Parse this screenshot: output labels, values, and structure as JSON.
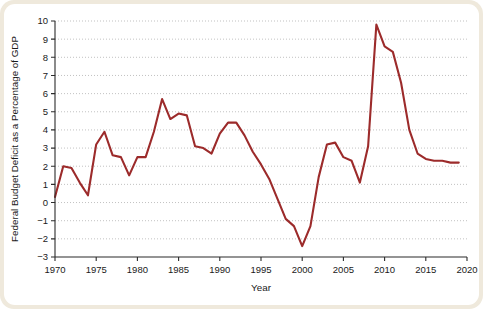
{
  "figure": {
    "frame_color": "#efe9dc",
    "plot_background": "#ffffff"
  },
  "chart_data": {
    "type": "line",
    "title": "",
    "subtitle": "",
    "xlabel": "Year",
    "ylabel": "Federal Budget Deficit as a Percentage of GDP",
    "xlim": [
      1970,
      2020
    ],
    "ylim": [
      -3,
      10
    ],
    "xticks": [
      1970,
      1975,
      1980,
      1985,
      1990,
      1995,
      2000,
      2005,
      2010,
      2015,
      2020
    ],
    "xtick_labels": [
      "1970",
      "1975",
      "1980",
      "1985",
      "1990",
      "1995",
      "2000",
      "2005",
      "2010",
      "2015",
      "2020"
    ],
    "yticks": [
      -3,
      -2,
      -1,
      0,
      1,
      2,
      3,
      4,
      5,
      6,
      7,
      8,
      9,
      10
    ],
    "ytick_labels": [
      "−3",
      "−2",
      "−1",
      "0",
      "1",
      "2",
      "3",
      "4",
      "5",
      "6",
      "7",
      "8",
      "9",
      "10"
    ],
    "grid": true,
    "grid_axis": "y",
    "grid_style": "dotted",
    "legend": false,
    "legend_position": "none",
    "line_color": "#9c2b2b",
    "line_width": 2.1,
    "x": [
      1970,
      1971,
      1972,
      1973,
      1974,
      1975,
      1976,
      1977,
      1978,
      1979,
      1980,
      1981,
      1982,
      1983,
      1984,
      1985,
      1986,
      1987,
      1988,
      1989,
      1990,
      1991,
      1992,
      1993,
      1994,
      1995,
      1996,
      1997,
      1998,
      1999,
      2000,
      2001,
      2002,
      2003,
      2004,
      2005,
      2006,
      2007,
      2008,
      2009,
      2010,
      2011,
      2012,
      2013,
      2014,
      2015,
      2016,
      2017,
      2018,
      2019
    ],
    "values": [
      0.3,
      2.0,
      1.9,
      1.1,
      0.4,
      3.2,
      3.9,
      2.6,
      2.5,
      1.5,
      2.5,
      2.5,
      3.9,
      5.7,
      4.6,
      4.9,
      4.8,
      3.1,
      3.0,
      2.7,
      3.8,
      4.4,
      4.4,
      3.7,
      2.8,
      2.1,
      1.3,
      0.2,
      -0.9,
      -1.3,
      -2.4,
      -1.3,
      1.4,
      3.2,
      3.3,
      2.5,
      2.3,
      1.1,
      3.1,
      9.8,
      8.6,
      8.3,
      6.6,
      4.0,
      2.7,
      2.4,
      2.3,
      2.3,
      2.2,
      2.2
    ],
    "series_name": "Federal Budget Deficit (% of GDP)"
  }
}
